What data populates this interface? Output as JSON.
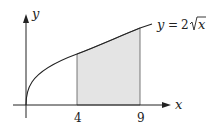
{
  "diagram": {
    "x_axis_label": "x",
    "y_axis_label": "y",
    "curve_label_lhs": "y",
    "curve_label_eq": "=",
    "curve_label_coef": "2",
    "curve_label_var": "x",
    "tick_a": "4",
    "tick_b": "9",
    "shade_color": "#e4e4e4",
    "line_color": "#222222"
  }
}
